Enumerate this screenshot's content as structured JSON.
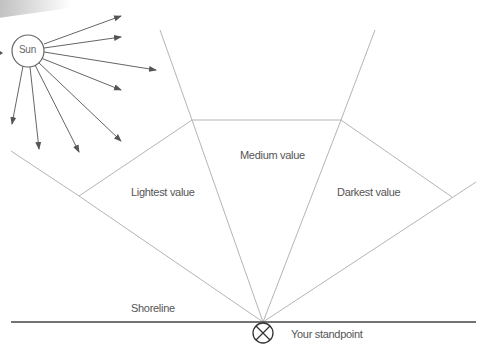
{
  "diagram": {
    "sun_label": "Sun",
    "regions": {
      "lightest": "Lightest value",
      "medium": "Medium value",
      "darkest": "Darkest value"
    },
    "shoreline_label": "Shoreline",
    "standpoint_label": "Your standpoint",
    "colors": {
      "guide_lines": "#b5b5b5",
      "arrows": "#555555",
      "shoreline": "#444444",
      "text": "#555555"
    }
  }
}
